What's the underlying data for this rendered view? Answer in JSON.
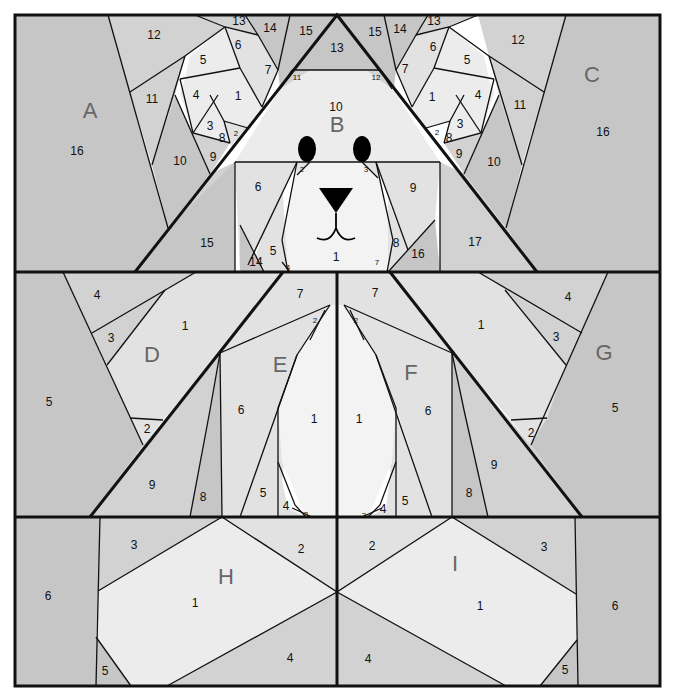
{
  "diagram": {
    "type": "paper-piecing-pattern",
    "colors": {
      "dark": "#c6c6c6",
      "mid": "#d2d2d2",
      "light": "#e2e2e2",
      "lighter": "#ececec",
      "white": "#f3f3f3",
      "line": "#111111",
      "letter": "#666666"
    },
    "sections": [
      {
        "letter": "A",
        "labels": [
          "16",
          "12",
          "11",
          "10",
          "13",
          "14",
          "15",
          "7",
          "6",
          "5",
          "4",
          "1",
          "3",
          "8",
          "2",
          "9"
        ]
      },
      {
        "letter": "B",
        "labels": [
          "13",
          "11",
          "12",
          "10",
          "6",
          "9",
          "2",
          "3",
          "1",
          "5",
          "4",
          "14",
          "15",
          "7",
          "8",
          "16",
          "17"
        ]
      },
      {
        "letter": "C",
        "labels": [
          "16",
          "12",
          "11",
          "10",
          "13",
          "14",
          "15",
          "7",
          "6",
          "5",
          "4",
          "1",
          "3",
          "8",
          "2",
          "9"
        ]
      },
      {
        "letter": "D",
        "labels": [
          "5",
          "4",
          "3",
          "1",
          "2",
          "9"
        ]
      },
      {
        "letter": "E",
        "labels": [
          "7",
          "2",
          "6",
          "1",
          "5",
          "4",
          "3",
          "8"
        ]
      },
      {
        "letter": "F",
        "labels": [
          "7",
          "2",
          "6",
          "1",
          "5",
          "4",
          "3",
          "8"
        ]
      },
      {
        "letter": "G",
        "labels": [
          "5",
          "4",
          "3",
          "1",
          "2",
          "9"
        ]
      },
      {
        "letter": "H",
        "labels": [
          "6",
          "3",
          "2",
          "1",
          "4",
          "5"
        ]
      },
      {
        "letter": "I",
        "labels": [
          "6",
          "3",
          "2",
          "1",
          "4",
          "5"
        ]
      }
    ],
    "letters": {
      "A": "A",
      "B": "B",
      "C": "C",
      "D": "D",
      "E": "E",
      "F": "F",
      "G": "G",
      "H": "H",
      "I": "I"
    },
    "labels": {
      "A16": "16",
      "A12": "12",
      "A11": "11",
      "A10": "10",
      "A13": "13",
      "A14": "14",
      "A15": "15",
      "A7": "7",
      "A6": "6",
      "A5": "5",
      "A4": "4",
      "A1": "1",
      "A3": "3",
      "A8": "8",
      "A2": "2",
      "A9": "9",
      "B13": "13",
      "B11": "11",
      "B12": "12",
      "B10": "10",
      "B6": "6",
      "B9": "9",
      "B2": "2",
      "B3": "3",
      "B1": "1",
      "B5": "5",
      "B4": "4",
      "B14": "14",
      "B15": "15",
      "B7": "7",
      "B8": "8",
      "B16": "16",
      "B17": "17",
      "C16": "16",
      "C12": "12",
      "C11": "11",
      "C10": "10",
      "C13": "13",
      "C14": "14",
      "C15": "15",
      "C7": "7",
      "C6": "6",
      "C5": "5",
      "C4": "4",
      "C1": "1",
      "C3": "3",
      "C8": "8",
      "C2": "2",
      "C9": "9",
      "D5": "5",
      "D4": "4",
      "D3": "3",
      "D1": "1",
      "D2": "2",
      "D9": "9",
      "E7": "7",
      "E2": "2",
      "E6": "6",
      "E1": "1",
      "E5": "5",
      "E4": "4",
      "E3": "3",
      "E8": "8",
      "F7": "7",
      "F2": "2",
      "F6": "6",
      "F1": "1",
      "F5": "5",
      "F4": "4",
      "F3": "3",
      "F8": "8",
      "G5": "5",
      "G4": "4",
      "G3": "3",
      "G1": "1",
      "G2": "2",
      "G9": "9",
      "H6": "6",
      "H3": "3",
      "H2": "2",
      "H1": "1",
      "H4": "4",
      "H5": "5",
      "I6": "6",
      "I3": "3",
      "I2": "2",
      "I1": "1",
      "I4": "4",
      "I5": "5"
    }
  }
}
